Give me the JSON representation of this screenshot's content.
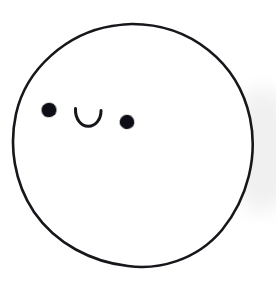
{
  "artwork": {
    "title": "Smiling face doodle",
    "description": "Hand-drawn ink circle with a kawaii face: two round black eyes at uneven heights and a small upward U-shaped smile between them",
    "medium": "ink pen line drawing on white paper",
    "canvas": {
      "width": 276,
      "height": 281,
      "background_color": "#ffffff"
    },
    "colors": {
      "ink": "#17171a",
      "eye_fill": "#111114",
      "paper": "#ffffff",
      "shadow_gray": "#efeff0"
    },
    "head": {
      "name": "head-outline",
      "shape": "circle",
      "center_x": 132,
      "center_y": 145,
      "radius_x": 120,
      "radius_y": 121,
      "stroke_width": 2.6,
      "fill": "#ffffff",
      "stroke": "#17171a",
      "hand_drawn": true,
      "path": "M 132 24 C 190 24 238 62 250 118 C 258 156 248 198 222 230 C 196 261 158 270 128 266 C 92 262 56 244 34 212 C 14 182 9 146 16 114 C 26 68 68 33 112 26 C 119 25 126 24 132 24 Z"
    },
    "eyes": [
      {
        "name": "left-eye",
        "center_x": 49,
        "center_y": 110,
        "radius_x": 7.6,
        "radius_y": 7.3,
        "rotation": -12,
        "fill": "#111114"
      },
      {
        "name": "right-eye",
        "center_x": 127,
        "center_y": 122,
        "radius_x": 7.4,
        "radius_y": 7.2,
        "rotation": 8,
        "fill": "#111114"
      }
    ],
    "mouth": {
      "name": "smile-mouth",
      "shape": "u-arc",
      "opening": "up",
      "left_x": 75,
      "right_x": 101,
      "top_y": 108,
      "bottom_y": 126,
      "stroke_width": 3.0,
      "stroke": "#17171a",
      "path": "M 75.5 108.5 C 75.0 119.5 81.5 126.5 88.5 126.3 C 95.6 126.1 101.2 119.2 101.0 110.5"
    },
    "shadow_smudge": {
      "name": "paper-shadow",
      "center_x": 262,
      "center_y": 150,
      "radius_x": 36,
      "radius_y": 62,
      "color": "#efeff0",
      "opacity": 0.9
    }
  }
}
